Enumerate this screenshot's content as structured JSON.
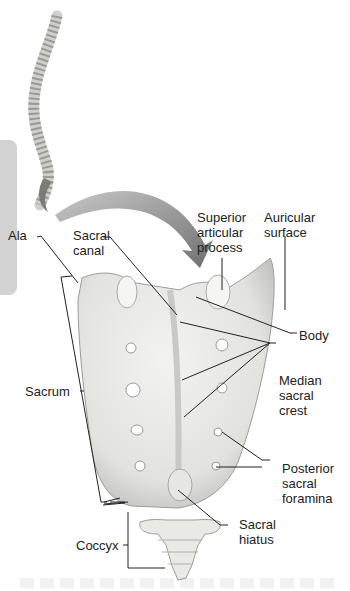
{
  "figure": {
    "colors": {
      "bone": "#e9e9e6",
      "bone_shadow": "#b9b9b5",
      "arrow": "#7a7a7a",
      "leader": "#222222",
      "side_tab": "#d2d2d2"
    }
  },
  "labels": {
    "ala": "Ala",
    "sacral_canal": "Sacral\ncanal",
    "superior_articular_process": "Superior\narticular\nprocess",
    "auricular_surface": "Auricular\nsurface",
    "body": "Body",
    "sacrum": "Sacrum",
    "median_sacral_crest": "Median\nsacral\ncrest",
    "posterior_sacral_foramina": "Posterior\nsacral\nforamina",
    "sacral_hiatus": "Sacral\nhiatus",
    "coccyx": "Coccyx"
  }
}
